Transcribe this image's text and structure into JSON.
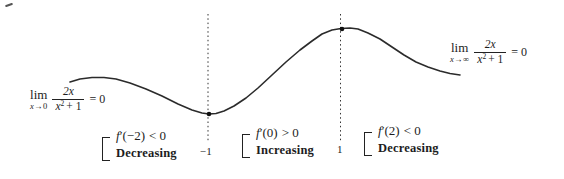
{
  "figure": {
    "point_labels": {
      "min": "−1",
      "max": "1"
    },
    "limit_left": {
      "lim": "lim",
      "sub_var": "x",
      "sub_arrow": "→",
      "sub_target": "0",
      "num": "2x",
      "den_var": "x",
      "den_exp": "2",
      "den_rest": "+ 1",
      "result": "= 0"
    },
    "limit_right": {
      "lim": "lim",
      "sub_var": "x",
      "sub_arrow": "→",
      "sub_target": "∞",
      "num": "2x",
      "den_var": "x",
      "den_exp": "2",
      "den_rest": "+ 1",
      "result": "= 0"
    },
    "annotations": [
      {
        "func": "f",
        "rest": "′(−2)",
        "relation": "< 0",
        "behavior": "Decreasing"
      },
      {
        "func": "f",
        "rest": "′(0)",
        "relation": "> 0",
        "behavior": "Increasing"
      },
      {
        "func": "f",
        "rest": "′(2)",
        "relation": "< 0",
        "behavior": "Decreasing"
      }
    ],
    "curve_color": "#2b2b2b",
    "curve_screen_points": [
      [
        70,
        82
      ],
      [
        80,
        79
      ],
      [
        92,
        77.5
      ],
      [
        104,
        77.5
      ],
      [
        116,
        79
      ],
      [
        130,
        83
      ],
      [
        146,
        89
      ],
      [
        162,
        96
      ],
      [
        178,
        104
      ],
      [
        192,
        110
      ],
      [
        202,
        113
      ],
      [
        209,
        114
      ],
      [
        216,
        113.5
      ],
      [
        224,
        111
      ],
      [
        234,
        106
      ],
      [
        246,
        98
      ],
      [
        258,
        88
      ],
      [
        272,
        75
      ],
      [
        286,
        62
      ],
      [
        300,
        50
      ],
      [
        312,
        41
      ],
      [
        322,
        34
      ],
      [
        332,
        30
      ],
      [
        341,
        28.5
      ],
      [
        350,
        28
      ],
      [
        358,
        29
      ],
      [
        368,
        33
      ],
      [
        380,
        39
      ],
      [
        392,
        47
      ],
      [
        404,
        55
      ],
      [
        416,
        62
      ],
      [
        428,
        67
      ],
      [
        440,
        71
      ],
      [
        450,
        73.5
      ],
      [
        460,
        75
      ]
    ],
    "critical_dots": [
      [
        209,
        114
      ],
      [
        342,
        29
      ]
    ],
    "guide_lines": [
      {
        "x": 208,
        "y1": 14,
        "y2": 142
      },
      {
        "x": 340.5,
        "y1": 14,
        "y2": 141
      }
    ]
  },
  "chart_data": {
    "type": "line",
    "title": "",
    "function": "f(x) = 2x/(x²+1)",
    "x": [
      -3,
      -2.5,
      -2,
      -1.5,
      -1,
      -0.5,
      0,
      0.5,
      1,
      1.5,
      2,
      2.5,
      3
    ],
    "y": [
      -0.6,
      -0.69,
      -0.8,
      -0.92,
      -1,
      -0.8,
      0,
      0.8,
      1,
      0.92,
      0.8,
      0.69,
      0.6
    ],
    "xlabel": "",
    "ylabel": "",
    "x_tick_labels": [
      "−1",
      "1"
    ],
    "critical_points": [
      {
        "x": -1,
        "y": -1,
        "kind": "local-minimum",
        "label": "−1"
      },
      {
        "x": 1,
        "y": 1,
        "kind": "local-maximum",
        "label": "1"
      }
    ],
    "horizontal_asymptote": "y = 0",
    "limits": [
      {
        "expression": "lim_{x→0} 2x/(x²+1)",
        "value": 0
      },
      {
        "expression": "lim_{x→∞} 2x/(x²+1)",
        "value": 0
      }
    ],
    "intervals": [
      {
        "test": "f′(−2) < 0",
        "behavior": "Decreasing"
      },
      {
        "test": "f′(0) > 0",
        "behavior": "Increasing"
      },
      {
        "test": "f′(2) < 0",
        "behavior": "Decreasing"
      }
    ],
    "grid": false,
    "legend": false
  }
}
